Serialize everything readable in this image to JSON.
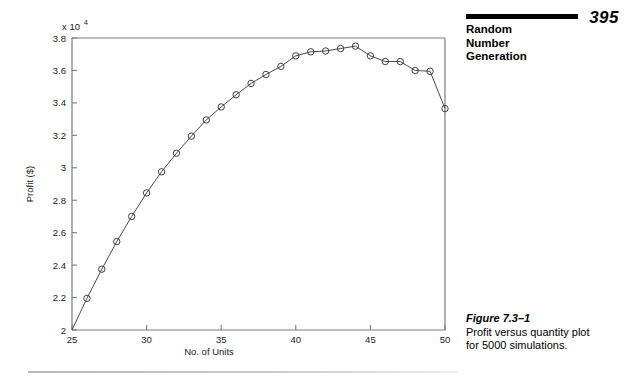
{
  "page": {
    "number": "395",
    "running_head_lines": [
      "Random",
      "Number",
      "Generation"
    ]
  },
  "caption": {
    "title": "Figure 7.3–1",
    "line1": "Profit versus quantity plot",
    "line2": "for 5000 simulations."
  },
  "chart_data": {
    "type": "line",
    "title": "",
    "xlabel": "No. of Units",
    "ylabel": "Profit ($)",
    "y_exponent_label": "x 10",
    "y_exponent_power": "4",
    "y_scale": 10000,
    "xlim": [
      25,
      50
    ],
    "ylim": [
      2.0,
      3.8
    ],
    "xticks": [
      25,
      30,
      35,
      40,
      45,
      50
    ],
    "xtick_labels": [
      "25",
      "30",
      "35",
      "40",
      "45",
      "50"
    ],
    "yticks": [
      2.0,
      2.2,
      2.4,
      2.6,
      2.8,
      3.0,
      3.2,
      3.4,
      3.6,
      3.8
    ],
    "ytick_labels": [
      "2",
      "2.2",
      "2.4",
      "2.6",
      "2.8",
      "3",
      "3.2",
      "3.4",
      "3.6",
      "3.8"
    ],
    "grid": false,
    "legend": false,
    "marker": "circle",
    "x": [
      25,
      26,
      27,
      28,
      29,
      30,
      31,
      32,
      33,
      34,
      35,
      36,
      37,
      38,
      39,
      40,
      41,
      42,
      43,
      44,
      45,
      46,
      47,
      48,
      49,
      50
    ],
    "y": [
      2.0,
      2.195,
      2.375,
      2.545,
      2.7,
      2.845,
      2.975,
      3.09,
      3.195,
      3.295,
      3.375,
      3.45,
      3.52,
      3.575,
      3.625,
      3.69,
      3.715,
      3.72,
      3.735,
      3.75,
      3.69,
      3.655,
      3.655,
      3.6,
      3.595,
      3.365
    ],
    "y_values_actual": [
      20000,
      21950,
      23750,
      25450,
      27000,
      28450,
      29750,
      30900,
      31950,
      32950,
      33750,
      34500,
      35200,
      35750,
      36250,
      36900,
      37150,
      37200,
      37350,
      37500,
      36900,
      36550,
      36550,
      36000,
      35950,
      33650
    ],
    "n_points": 26
  }
}
